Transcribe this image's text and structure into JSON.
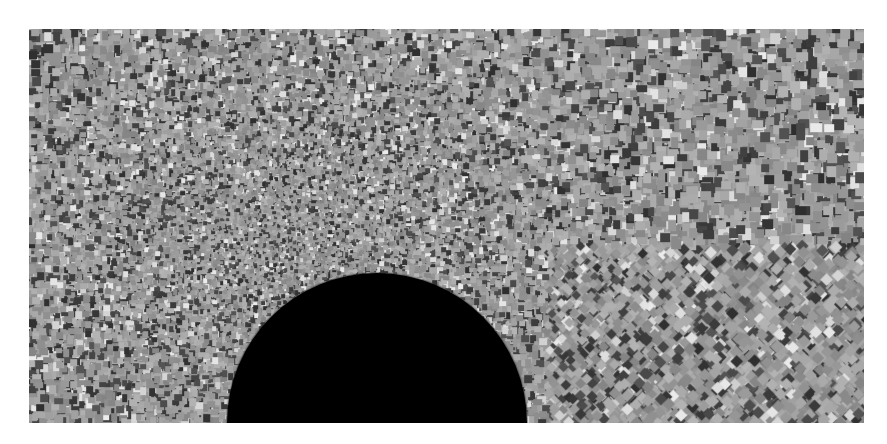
{
  "figure": {
    "background": "#ffffff",
    "panel": {
      "x": 29,
      "y": 29,
      "width": 835,
      "height": 394
    },
    "texture": {
      "description": "grayscale mesh cell field, fine cells upstream-left of obstacle, coarse cells in corners",
      "gray_min": "#2e2e2e",
      "gray_max": "#ececec",
      "gray_mean": "#9c9c9c",
      "coarse_cell_px": 9,
      "fine_cell_px": 3,
      "fine_region_center": {
        "x": 260,
        "y": 200
      },
      "seed": 1337
    },
    "obstacle": {
      "shape": "half-disk",
      "color": "#000000",
      "center_x": 348,
      "base_y": 394,
      "radius": 150
    }
  }
}
